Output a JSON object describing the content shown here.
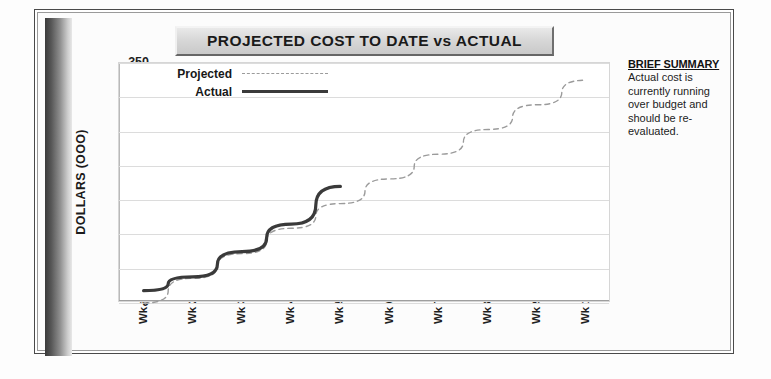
{
  "title": "PROJECTED COST TO DATE vs ACTUAL",
  "summary": {
    "heading": "BRIEF SUMMARY",
    "body": "Actual cost is currently running over budget and should be re-evaluated."
  },
  "legend": {
    "projected_label": "Projected",
    "actual_label": "Actual"
  },
  "colors": {
    "actual_line": "#3a3a3a",
    "projected_line": "#9b9b9b",
    "grid": "#dcdcdc",
    "title_plate": "#d8d8d8",
    "dark_bar": "#3a3a3a"
  },
  "chart_data": {
    "type": "line",
    "title": "PROJECTED COST TO DATE vs ACTUAL",
    "xlabel": "",
    "ylabel": "DOLLARS (OOO)",
    "categories": [
      "Wk 1",
      "Wk 2",
      "Wk 3",
      "Wk 4",
      "Wk 5",
      "Wk 6",
      "Wk 7",
      "Wk 8",
      "Wk 9",
      "Wk 10"
    ],
    "yticks": [
      0,
      50,
      100,
      150,
      200,
      250,
      300,
      350
    ],
    "ylim": [
      0,
      350
    ],
    "grid": true,
    "legend_position": "top-left-inside",
    "series": [
      {
        "name": "Projected",
        "style": "dashed",
        "color": "#9b9b9b",
        "values": [
          0,
          36,
          72,
          109,
          145,
          181,
          217,
          253,
          289,
          325
        ]
      },
      {
        "name": "Actual",
        "style": "solid",
        "color": "#3a3a3a",
        "values": [
          18,
          38,
          75,
          115,
          170,
          null,
          null,
          null,
          null,
          null
        ]
      }
    ]
  }
}
